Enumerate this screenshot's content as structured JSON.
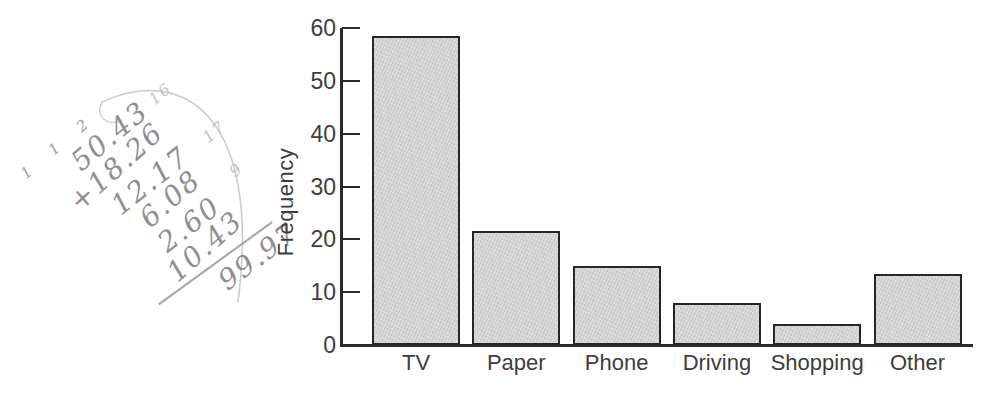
{
  "handwriting": {
    "carry_digits": "1 1 2",
    "addends": [
      "50.43",
      "+18.26",
      "12.17",
      "6.08",
      "2.60",
      "10.43"
    ],
    "total": "99.97",
    "margin_notes": [
      "16",
      "17",
      "9"
    ],
    "pencil_color": "#8f8f8f"
  },
  "chart_data": {
    "type": "bar",
    "title": "",
    "xlabel": "",
    "ylabel": "Frequency",
    "categories": [
      "TV",
      "Paper",
      "Phone",
      "Driving",
      "Shopping",
      "Other"
    ],
    "values": [
      58.5,
      21.5,
      15,
      8,
      4,
      13.5
    ],
    "ylim": [
      0,
      60
    ],
    "yticks": [
      0,
      10,
      20,
      30,
      40,
      50,
      60
    ],
    "grid": false,
    "legend": false,
    "bar_fill": "#d7d7d7",
    "bar_border": "#262626",
    "axis_color": "#2a2a2a",
    "label_color": "#3d3d3d"
  }
}
